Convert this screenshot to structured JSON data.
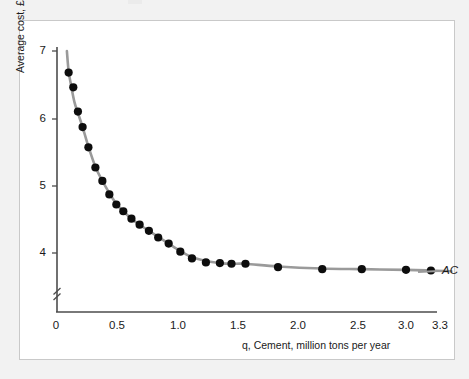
{
  "figure": {
    "curve_label": "AC",
    "axes": {
      "y_title": "Average cost, £",
      "x_title": "q, Cement, million tons per year",
      "y_ticks": [
        "7",
        "6",
        "5",
        "4"
      ],
      "x_ticks": [
        "0",
        "0.5",
        "1.0",
        "1.5",
        "2.0",
        "2.5",
        "3.0",
        "3.3"
      ]
    },
    "colors": {
      "curve": "#9a9a9a",
      "point": "#0d0d0d",
      "axis": "#4d4d4d",
      "frame": "#c9c9c9",
      "page_background": "#f2f2f2",
      "figure_background": "#ffffff"
    }
  },
  "chart_data": {
    "type": "scatter",
    "title": "",
    "subtitle": "",
    "xlabel": "q, Cement, million tons per year",
    "ylabel": "Average cost, £",
    "xlim": [
      0,
      3.3
    ],
    "ylim": [
      3.4,
      7.1
    ],
    "grid": false,
    "legend": "none",
    "y_axis_break": true,
    "x_tick_values": [
      0,
      0.5,
      1.0,
      1.5,
      2.0,
      2.5,
      3.0,
      3.3
    ],
    "x_tick_labels": [
      "0",
      "0.5",
      "1.0",
      "1.5",
      "2.0",
      "2.5",
      "3.0",
      "3.3"
    ],
    "y_tick_values": [
      7,
      6,
      5,
      4
    ],
    "y_tick_labels": [
      "7",
      "6",
      "5",
      "4"
    ],
    "annotations": [
      {
        "text": "AC",
        "x": 3.32,
        "y": 3.63,
        "style": "italic",
        "role": "curve-label"
      }
    ],
    "series": [
      {
        "name": "AC",
        "type": "scatter-with-line",
        "marker": "filled-circle",
        "line_color": "#9a9a9a",
        "marker_color": "#0d0d0d",
        "x": [
          0.1,
          0.14,
          0.18,
          0.22,
          0.27,
          0.33,
          0.39,
          0.45,
          0.51,
          0.57,
          0.64,
          0.71,
          0.79,
          0.87,
          0.96,
          1.06,
          1.16,
          1.28,
          1.4,
          1.5,
          1.62,
          1.9,
          2.28,
          2.62,
          3.0,
          3.22
        ],
        "y": [
          6.68,
          6.46,
          6.1,
          5.87,
          5.57,
          5.27,
          5.07,
          4.87,
          4.72,
          4.62,
          4.51,
          4.42,
          4.33,
          4.23,
          4.14,
          4.02,
          3.92,
          3.86,
          3.85,
          3.84,
          3.84,
          3.79,
          3.76,
          3.76,
          3.75,
          3.74
        ]
      }
    ],
    "curve_path_x": [
      0.085,
      0.1,
      0.12,
      0.15,
      0.18,
      0.22,
      0.27,
      0.33,
      0.39,
      0.45,
      0.51,
      0.57,
      0.64,
      0.71,
      0.79,
      0.87,
      0.96,
      1.06,
      1.16,
      1.28,
      1.4,
      1.5,
      1.62,
      1.9,
      2.28,
      2.62,
      3.0,
      3.22,
      3.4
    ],
    "curve_path_y": [
      7.0,
      6.7,
      6.5,
      6.24,
      6.08,
      5.87,
      5.58,
      5.28,
      5.07,
      4.89,
      4.73,
      4.62,
      4.51,
      4.42,
      4.33,
      4.24,
      4.14,
      4.03,
      3.94,
      3.88,
      3.85,
      3.84,
      3.84,
      3.8,
      3.77,
      3.76,
      3.75,
      3.74,
      3.73
    ]
  }
}
